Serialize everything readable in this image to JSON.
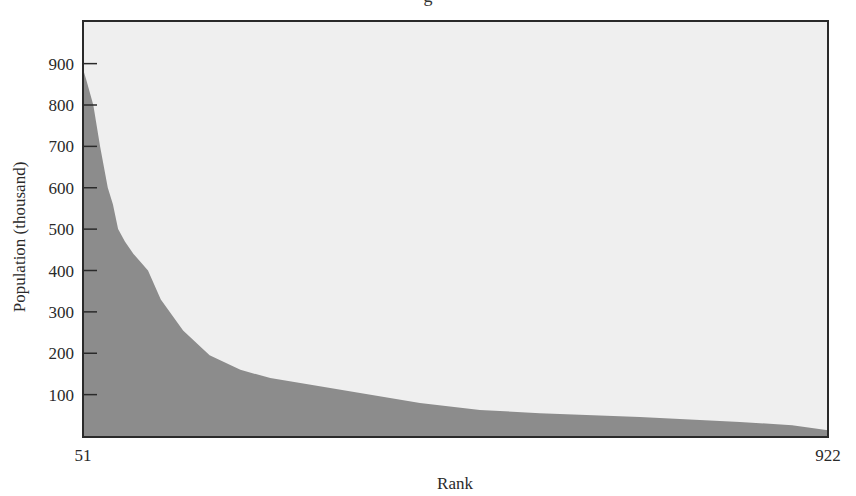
{
  "chart_data": {
    "type": "area",
    "title": "",
    "title_fragment": "g",
    "xlabel": "Rank",
    "ylabel": "Population (thousand)",
    "x_tick_labels": [
      "51",
      "922"
    ],
    "xlim": [
      51,
      922
    ],
    "y_ticks": [
      100,
      200,
      300,
      400,
      500,
      600,
      700,
      800,
      900
    ],
    "y_tick_labels": [
      "100",
      "200",
      "300",
      "400",
      "500",
      "600",
      "700",
      "800",
      "900"
    ],
    "ylim": [
      0,
      1005
    ],
    "grid": false,
    "legend": null,
    "series": [
      {
        "name": "Population",
        "x": [
          51,
          52,
          55,
          63,
          71,
          80,
          86,
          92,
          100,
          110,
          127,
          142,
          168,
          199,
          235,
          270,
          305,
          375,
          445,
          515,
          585,
          702,
          819,
          880,
          922
        ],
        "values": [
          880,
          880,
          860,
          800,
          700,
          600,
          560,
          500,
          470,
          440,
          400,
          330,
          255,
          195,
          160,
          140,
          128,
          104,
          80,
          63,
          55,
          46,
          34,
          26,
          14
        ]
      }
    ],
    "colors": {
      "plot_background": "#efefef",
      "fill": "#8c8c8c",
      "frame": "#2a2a2a"
    }
  }
}
